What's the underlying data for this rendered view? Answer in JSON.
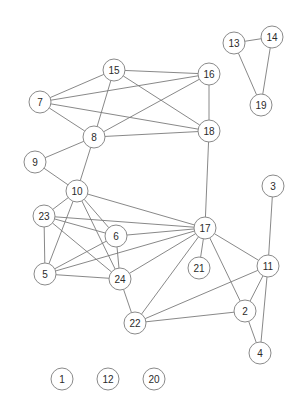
{
  "graph": {
    "title": "undirected node-link network graph",
    "width": 306,
    "height": 415,
    "background_color": "#ffffff",
    "node_fill_color": "#ffffff",
    "node_stroke_color": "#8a8a8a",
    "node_label_color": "#2b2b2b",
    "edge_color": "#7b7b7b",
    "node_radius": 11,
    "node_count": 24,
    "edge_count": 56,
    "isolated_nodes": [
      "1",
      "12",
      "20"
    ],
    "nodes": [
      {
        "id": "1",
        "label": "1",
        "x": 62,
        "y": 379
      },
      {
        "id": "2",
        "label": "2",
        "x": 245,
        "y": 311
      },
      {
        "id": "3",
        "label": "3",
        "x": 273,
        "y": 186
      },
      {
        "id": "4",
        "label": "4",
        "x": 260,
        "y": 353
      },
      {
        "id": "5",
        "label": "5",
        "x": 45,
        "y": 274
      },
      {
        "id": "6",
        "label": "6",
        "x": 116,
        "y": 236
      },
      {
        "id": "7",
        "label": "7",
        "x": 40,
        "y": 102
      },
      {
        "id": "8",
        "label": "8",
        "x": 94,
        "y": 137
      },
      {
        "id": "9",
        "label": "9",
        "x": 35,
        "y": 162
      },
      {
        "id": "10",
        "label": "10",
        "x": 77,
        "y": 191
      },
      {
        "id": "11",
        "label": "11",
        "x": 268,
        "y": 266
      },
      {
        "id": "12",
        "label": "12",
        "x": 108,
        "y": 379
      },
      {
        "id": "13",
        "label": "13",
        "x": 234,
        "y": 43
      },
      {
        "id": "14",
        "label": "14",
        "x": 272,
        "y": 37
      },
      {
        "id": "15",
        "label": "15",
        "x": 114,
        "y": 70
      },
      {
        "id": "16",
        "label": "16",
        "x": 209,
        "y": 74
      },
      {
        "id": "17",
        "label": "17",
        "x": 205,
        "y": 228
      },
      {
        "id": "18",
        "label": "18",
        "x": 209,
        "y": 131
      },
      {
        "id": "19",
        "label": "19",
        "x": 261,
        "y": 105
      },
      {
        "id": "20",
        "label": "20",
        "x": 154,
        "y": 379
      },
      {
        "id": "21",
        "label": "21",
        "x": 199,
        "y": 268
      },
      {
        "id": "22",
        "label": "22",
        "x": 135,
        "y": 323
      },
      {
        "id": "23",
        "label": "23",
        "x": 44,
        "y": 216
      },
      {
        "id": "24",
        "label": "24",
        "x": 120,
        "y": 279
      }
    ],
    "edges": [
      {
        "source": "13",
        "target": "14"
      },
      {
        "source": "13",
        "target": "19"
      },
      {
        "source": "14",
        "target": "19"
      },
      {
        "source": "15",
        "target": "16"
      },
      {
        "source": "15",
        "target": "7"
      },
      {
        "source": "15",
        "target": "8"
      },
      {
        "source": "15",
        "target": "18"
      },
      {
        "source": "16",
        "target": "7"
      },
      {
        "source": "16",
        "target": "8"
      },
      {
        "source": "16",
        "target": "18"
      },
      {
        "source": "7",
        "target": "8"
      },
      {
        "source": "7",
        "target": "18"
      },
      {
        "source": "8",
        "target": "18"
      },
      {
        "source": "8",
        "target": "9"
      },
      {
        "source": "8",
        "target": "10"
      },
      {
        "source": "9",
        "target": "10"
      },
      {
        "source": "18",
        "target": "17"
      },
      {
        "source": "10",
        "target": "23"
      },
      {
        "source": "10",
        "target": "5"
      },
      {
        "source": "10",
        "target": "6"
      },
      {
        "source": "10",
        "target": "24"
      },
      {
        "source": "10",
        "target": "17"
      },
      {
        "source": "23",
        "target": "5"
      },
      {
        "source": "23",
        "target": "6"
      },
      {
        "source": "23",
        "target": "24"
      },
      {
        "source": "23",
        "target": "17"
      },
      {
        "source": "5",
        "target": "6"
      },
      {
        "source": "5",
        "target": "24"
      },
      {
        "source": "5",
        "target": "17"
      },
      {
        "source": "6",
        "target": "24"
      },
      {
        "source": "6",
        "target": "17"
      },
      {
        "source": "24",
        "target": "17"
      },
      {
        "source": "24",
        "target": "22"
      },
      {
        "source": "17",
        "target": "21"
      },
      {
        "source": "17",
        "target": "22"
      },
      {
        "source": "17",
        "target": "11"
      },
      {
        "source": "17",
        "target": "2"
      },
      {
        "source": "11",
        "target": "3"
      },
      {
        "source": "11",
        "target": "2"
      },
      {
        "source": "11",
        "target": "4"
      },
      {
        "source": "11",
        "target": "22"
      },
      {
        "source": "2",
        "target": "4"
      },
      {
        "source": "2",
        "target": "22"
      }
    ]
  }
}
